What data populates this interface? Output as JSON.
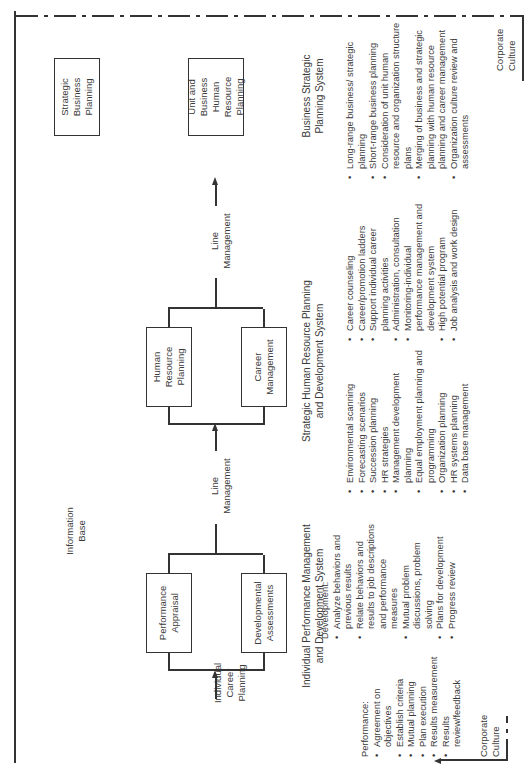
{
  "diagram": {
    "orientation": "rotated-90-ccw",
    "top_info_base_label": "Information\nBase",
    "corporate_culture_top": "Corporate\nCulture",
    "corporate_culture_bottom": "Corporate\nCulture",
    "inputs": {
      "individual_career_planning": "Individual\nCareer\nPlanning",
      "line_management_1": "Line\nManagement",
      "line_management_2": "Line\nManagement"
    },
    "systems": [
      {
        "id": "individual",
        "title": "Individual Performance Management\nand Development System",
        "boxes": [
          "Performance\nAppraisal",
          "Developmental\nAssessments"
        ],
        "lists": [
          {
            "heading": "Performance:",
            "items": [
              "Agreement on objectives",
              "Establish criteria",
              "Mutual planning",
              "Plan execution",
              "Results measurement",
              "Results review/feedback"
            ]
          },
          {
            "heading": "Development:",
            "items": [
              "Analyze behaviors and previous results",
              "Relate behaviors and results to job descriptions and performance measures",
              "Mutual problem discussions, problem solving",
              "Plans for development",
              "Progress review"
            ]
          }
        ]
      },
      {
        "id": "strategic_hr",
        "title": "Strategic Human Resource Planning\nand Development System",
        "boxes": [
          "Human\nResource\nPlanning",
          "Career\nManagement"
        ],
        "lists": [
          {
            "heading": "",
            "items": [
              "Environmental scanning",
              "Forecasting scenarios",
              "Succession planning",
              "HR strategies",
              "Management development planning",
              "Equal employment planning and programming",
              "Organization planning",
              "HR systems planning",
              "Data base management"
            ]
          },
          {
            "heading": "",
            "items": [
              "Career counseling",
              "Career/promotion ladders",
              "Support individual career planning activities",
              "Administration, consultation",
              "Monitoring-individual performance management and development system",
              "High potential program",
              "Job analysis and work design"
            ]
          }
        ]
      },
      {
        "id": "business_strategic",
        "title": "Business Strategic\nPlanning System",
        "boxes": [
          "Strategic\nBusiness\nPlanning",
          "Unit and\nBusiness\nHuman\nResource\nPlanning"
        ],
        "lists": [
          {
            "heading": "",
            "items": [
              "Long-range business/ strategic planning",
              "Short-range business planning",
              "Consideration of unit human resource and organization structure plans",
              "Merging of business and strategic planning with human resource planning and career management",
              "Organization culture review and assessments"
            ]
          }
        ]
      }
    ]
  }
}
